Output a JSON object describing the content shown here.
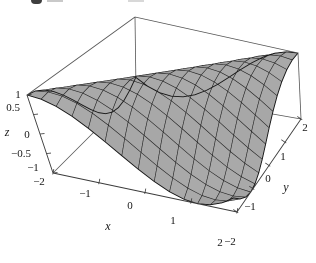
{
  "chart_data": {
    "type": "surface",
    "title": "",
    "xlabel": "x",
    "ylabel": "y",
    "zlabel": "z",
    "x_range": [
      -2,
      2
    ],
    "y_range": [
      -2,
      2
    ],
    "z_range": [
      -1,
      1
    ],
    "x_ticks": {
      "values": [
        -2,
        -1,
        0,
        1,
        2
      ],
      "labels": [
        "−2",
        "−1",
        "0",
        "1",
        "2"
      ]
    },
    "y_ticks": {
      "values": [
        -2,
        -1,
        0,
        1,
        2
      ],
      "labels": [
        "−2",
        "−1",
        "0",
        "1",
        "2"
      ]
    },
    "z_ticks": {
      "values": [
        -1,
        -0.5,
        0,
        0.5,
        1
      ],
      "labels": [
        "−1",
        "−0.5",
        "0",
        "0.5",
        "1"
      ]
    },
    "z_expression": "cos(x - y)",
    "mesh_divisions": 14,
    "z_samples": {
      "x": [
        -2,
        -1,
        0,
        1,
        2
      ],
      "y": [
        -2,
        -1,
        0,
        1,
        2
      ],
      "z": [
        [
          1.0,
          0.54,
          -0.416,
          -0.99,
          -0.654
        ],
        [
          0.54,
          1.0,
          0.54,
          -0.416,
          -0.99
        ],
        [
          -0.416,
          0.54,
          1.0,
          0.54,
          -0.416
        ],
        [
          -0.99,
          -0.416,
          0.54,
          1.0,
          0.54
        ],
        [
          -0.654,
          -0.99,
          -0.416,
          0.54,
          1.0
        ]
      ]
    },
    "layout_hints": {
      "boxed": true,
      "grid": "mesh",
      "legend": "none"
    },
    "colors": {
      "surface": "#a0a0a0",
      "mesh_line": "#1c1c1c",
      "axis_line": "#3a3a3a",
      "box_line": "#555555",
      "text": "#161616",
      "background": "#ffffff"
    }
  }
}
